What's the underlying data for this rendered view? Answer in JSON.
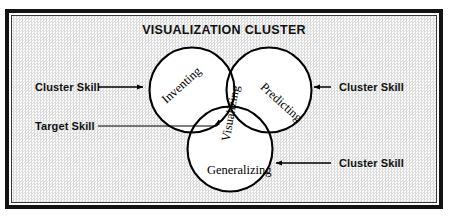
{
  "diagram": {
    "title": "VISUALIZATION CLUSTER",
    "type": "venn",
    "sets": [
      {
        "id": "inventing",
        "label": "Inventing",
        "position": "left",
        "role": "cluster-skill"
      },
      {
        "id": "predicting",
        "label": "Predicting",
        "position": "right",
        "role": "cluster-skill"
      },
      {
        "id": "generalizing",
        "label": "Generalizing",
        "position": "bottom",
        "role": "cluster-skill"
      }
    ],
    "intersection": {
      "id": "visualizing",
      "label": "Visualizing",
      "role": "target-skill"
    },
    "annotations": [
      {
        "id": "cluster-skill-left",
        "label": "Cluster Skill",
        "arrow": "right",
        "target": "inventing"
      },
      {
        "id": "target-skill-left",
        "label": "Target Skill",
        "arrow": "right",
        "target": "visualizing"
      },
      {
        "id": "cluster-skill-right",
        "label": "Cluster Skill",
        "arrow": "left",
        "target": "predicting"
      },
      {
        "id": "cluster-skill-bottom-right",
        "label": "Cluster Skill",
        "arrow": "left",
        "target": "generalizing"
      }
    ],
    "colors": {
      "frame": "#131313",
      "inner_border": "#3a3a3a",
      "background": "#f2f2f2",
      "circle_stroke": "#000000",
      "circle_fill": "#ffffff",
      "text": "#111111"
    }
  }
}
